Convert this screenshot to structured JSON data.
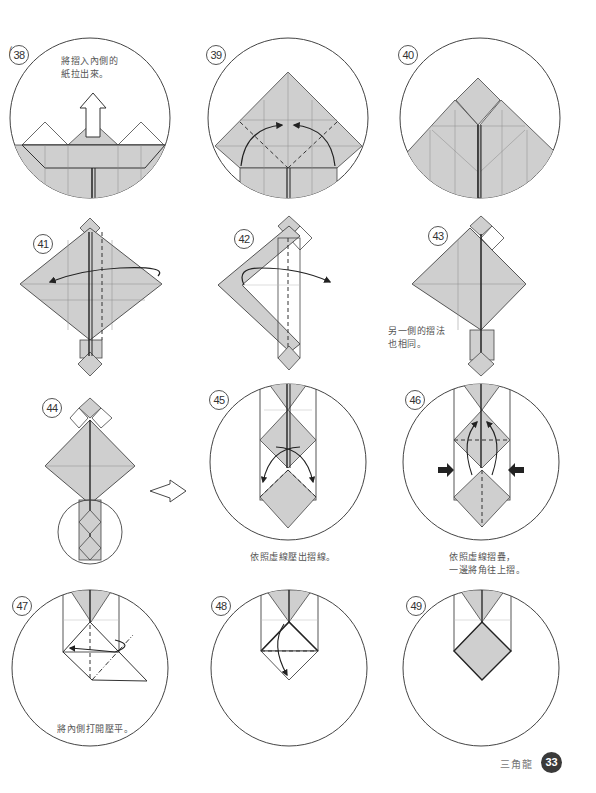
{
  "page": {
    "title": "三角龍",
    "page_number": "33",
    "fill_color": "#cfcfcf",
    "line_color": "#333333"
  },
  "steps": [
    {
      "number": "38",
      "text": "將摺入內側的\n紙拉出來。"
    },
    {
      "number": "39",
      "text": ""
    },
    {
      "number": "40",
      "text": ""
    },
    {
      "number": "41",
      "text": ""
    },
    {
      "number": "42",
      "text": ""
    },
    {
      "number": "43",
      "text": "另一側的摺法\n也相同。"
    },
    {
      "number": "44",
      "text": ""
    },
    {
      "number": "45",
      "text": "依照虛線壓出摺線。"
    },
    {
      "number": "46",
      "text": "依照虛線摺疊，\n一邊將角往上摺。"
    },
    {
      "number": "47",
      "text": "將內側打開壓平。"
    },
    {
      "number": "48",
      "text": ""
    },
    {
      "number": "49",
      "text": ""
    }
  ],
  "icons": {
    "arrow_up": "hollow-up-arrow",
    "arrow_right": "hollow-right-arrow",
    "push_arrow": "solid-push-arrow"
  }
}
